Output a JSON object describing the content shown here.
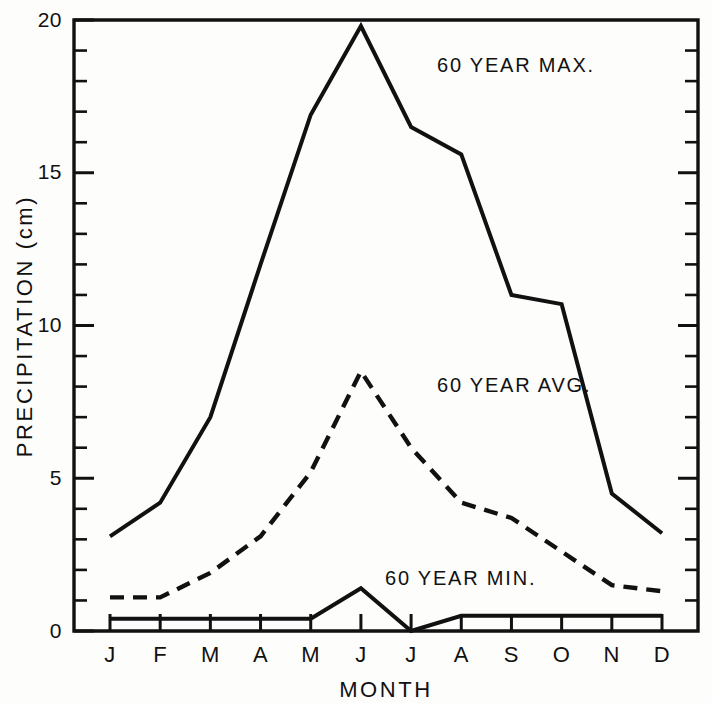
{
  "chart_data": {
    "type": "line",
    "title": "",
    "subtitle": "",
    "xlabel": "MONTH",
    "ylabel": "PRECIPITATION (cm)",
    "categories": [
      "J",
      "F",
      "M",
      "A",
      "M",
      "J",
      "J",
      "A",
      "S",
      "O",
      "N",
      "D"
    ],
    "xlim": [
      0,
      11
    ],
    "ylim": [
      0,
      20
    ],
    "grid": false,
    "legend_position": "inline-annotations",
    "y_major_ticks": [
      0,
      5,
      10,
      15,
      20
    ],
    "y_major_tick_labels": [
      "0",
      "5",
      "10",
      "15",
      "20"
    ],
    "y_minor_tick_step": 1,
    "series": [
      {
        "name": "60 YEAR MAX.",
        "style": "solid",
        "annotation": "60 YEAR MAX.",
        "values": [
          3.1,
          4.2,
          7.0,
          12.0,
          16.9,
          19.8,
          16.5,
          15.6,
          11.0,
          10.7,
          4.5,
          3.2
        ]
      },
      {
        "name": "60 YEAR AVG.",
        "style": "dashed",
        "annotation": "60 YEAR AVG.",
        "values": [
          1.1,
          1.1,
          1.9,
          3.1,
          5.2,
          8.5,
          6.0,
          4.2,
          3.7,
          2.6,
          1.5,
          1.3
        ]
      },
      {
        "name": "60 YEAR MIN.",
        "style": "solid",
        "annotation": "60 YEAR MIN.",
        "values": [
          0.4,
          0.4,
          0.4,
          0.4,
          0.4,
          1.4,
          0.0,
          0.5,
          0.5,
          0.5,
          0.5,
          0.5
        ]
      }
    ],
    "annotations": [
      {
        "text": "60 YEAR MAX.",
        "x_px": 437,
        "y_px": 72
      },
      {
        "text": "60 YEAR AVG.",
        "x_px": 437,
        "y_px": 392
      },
      {
        "text": "60 YEAR MIN.",
        "x_px": 385,
        "y_px": 585
      }
    ],
    "colors": {
      "line": "#111111",
      "background": "#fdfdfc",
      "text": "#111111"
    }
  }
}
